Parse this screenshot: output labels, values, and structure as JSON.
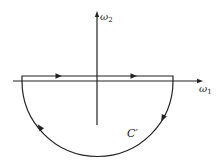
{
  "diagram": {
    "title": "",
    "axes": {
      "horizontal_label": "ω",
      "horizontal_subscript": "1",
      "vertical_label": "ω",
      "vertical_subscript": "2"
    },
    "contour": {
      "label": "C′",
      "shape": "closed contour: segment along/above real axis plus lower semicircle",
      "orientation": "clockwise",
      "arrows": [
        "top-segment-left",
        "top-segment-right",
        "arc-lower-right",
        "arc-lower-left"
      ]
    },
    "colors": {
      "stroke": "#222222",
      "background": "#ffffff"
    }
  }
}
